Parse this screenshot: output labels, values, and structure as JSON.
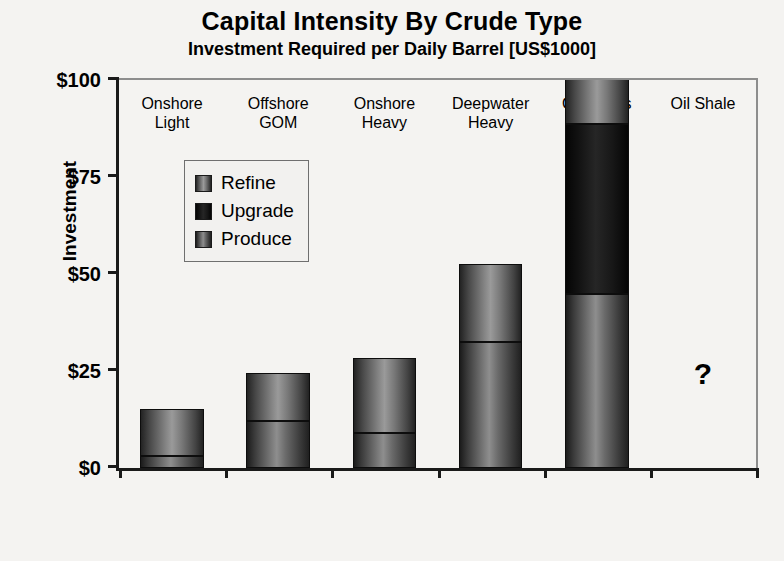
{
  "chart_data": {
    "type": "bar",
    "subtype": "stacked-column",
    "title": "Capital Intensity By Crude Type",
    "subtitle": "Investment Required per Daily Barrel [US$1000]",
    "xlabel": "",
    "ylabel": "Investment",
    "ylim": [
      0,
      100
    ],
    "yticks": [
      0,
      25,
      50,
      75,
      100
    ],
    "ytick_labels": [
      "$0",
      "$25",
      "$50",
      "$75",
      "$100"
    ],
    "grid": false,
    "legend_position": "inside-upper-left",
    "categories": [
      "Onshore\nLight",
      "Offshore\nGOM",
      "Onshore\nHeavy",
      "Deepwater\nHeavy",
      "Oil Sands",
      "Oil Shale"
    ],
    "series": [
      {
        "name": "Produce",
        "values": [
          3.0,
          12.1,
          8.9,
          32.5,
          44.8,
          null
        ]
      },
      {
        "name": "Upgrade",
        "values": [
          0.0,
          0.0,
          0.0,
          0.0,
          43.8,
          null
        ]
      },
      {
        "name": "Refine",
        "values": [
          12.3,
          12.3,
          19.5,
          20.2,
          14.5,
          null
        ]
      }
    ],
    "totals": [
      15.3,
      24.4,
      28.4,
      52.7,
      103.1,
      null
    ],
    "annotations": [
      {
        "text": "?",
        "category": "Oil Shale",
        "value": 20
      }
    ]
  },
  "legend": {
    "items": [
      {
        "label": "Refine",
        "color": "#8a8a8a"
      },
      {
        "label": "Upgrade",
        "color": "#1c1c1c"
      },
      {
        "label": "Produce",
        "color": "#808080"
      }
    ]
  },
  "colors": {
    "produce": "#808080",
    "upgrade": "#1c1c1c",
    "refine": "#8a8a8a",
    "axis": "#1a1a1a",
    "background": "#f4f3f1"
  }
}
